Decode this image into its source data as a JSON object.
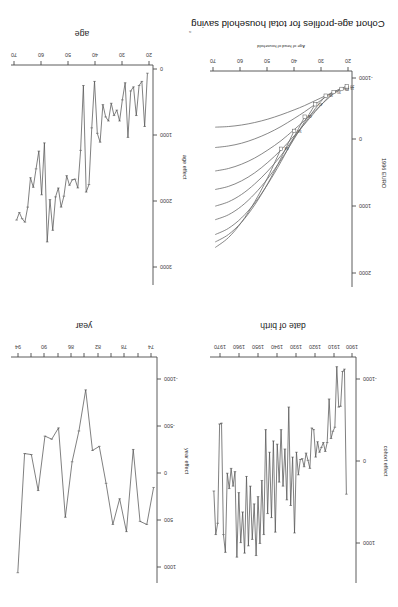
{
  "figure": {
    "orientation": "rotated-180",
    "panel_count": 4,
    "background": "#ffffff",
    "line_color": "#555555",
    "axis_color": "#4a4a4a"
  },
  "panels": {
    "cohort_profiles": {
      "position": "bottom-left",
      "title": "Cohort age-profiles for total household saving",
      "xlabel": "Age of head of household",
      "ylabel": "1996 EURO",
      "x_ticks": [
        "20",
        "30",
        "40",
        "50",
        "60",
        "70"
      ],
      "y_ticks": [
        "2000",
        "1000",
        "0",
        "-1000"
      ],
      "cohort_labels": [
        "15",
        "20",
        "25",
        "30",
        "35",
        "40",
        "45",
        "50",
        "55"
      ]
    },
    "cohort_effect": {
      "position": "top-left",
      "xlabel": "date of birth",
      "ylabel": "cohort effect",
      "x_ticks": [
        "1900",
        "1910",
        "1920",
        "1930",
        "1940",
        "1950",
        "1960",
        "1970"
      ],
      "y_ticks": [
        "1000",
        "0",
        "-1000"
      ]
    },
    "year_effect": {
      "position": "top-right",
      "xlabel": "year",
      "ylabel": "year effect",
      "x_ticks": [
        "74",
        "76",
        "78",
        "80",
        "82",
        "84",
        "86",
        "88",
        "90",
        "92",
        "94"
      ],
      "y_ticks": [
        "1000",
        "500",
        "0",
        "-500",
        "-1000"
      ]
    },
    "age_effect": {
      "position": "bottom-right",
      "xlabel": "age",
      "ylabel": "age effect",
      "x_ticks": [
        "20",
        "30",
        "40",
        "50",
        "60",
        "70"
      ],
      "y_ticks": [
        "3000",
        "2000",
        "1000",
        "0"
      ],
      "edge_fragment": "a"
    }
  },
  "chart_data": [
    {
      "id": "cohort_profiles",
      "type": "line",
      "title": "Cohort age-profiles for total household saving",
      "xlabel": "Age of head of household",
      "ylabel": "1996 EURO",
      "xlim": [
        18,
        72
      ],
      "ylim": [
        -1300,
        2200
      ],
      "grid": false,
      "legend": "inline-endpoint-labels",
      "series": [
        {
          "name": "15",
          "label_at_end": true,
          "x": [
            20,
            22,
            25,
            28,
            32,
            36,
            40,
            45,
            50,
            55,
            60,
            65,
            70
          ],
          "y": [
            -1020,
            -1000,
            -960,
            -900,
            -820,
            -740,
            -670,
            -590,
            -520,
            -465,
            -425,
            -400,
            -390
          ]
        },
        {
          "name": "20",
          "label_at_end": true,
          "x": [
            20,
            22,
            25,
            28,
            32,
            36,
            40,
            45,
            50,
            55,
            60,
            65,
            70
          ],
          "y": [
            -1050,
            -1020,
            -960,
            -880,
            -760,
            -640,
            -530,
            -400,
            -290,
            -200,
            -130,
            -85,
            -60
          ]
        },
        {
          "name": "25",
          "label_at_end": true,
          "x": [
            22,
            25,
            28,
            32,
            36,
            40,
            45,
            50,
            55,
            60,
            65,
            70
          ],
          "y": [
            -1010,
            -930,
            -820,
            -660,
            -500,
            -350,
            -170,
            -20,
            110,
            210,
            280,
            320
          ]
        },
        {
          "name": "30",
          "label_at_end": true,
          "x": [
            25,
            28,
            32,
            36,
            40,
            45,
            50,
            55,
            60,
            65,
            70
          ],
          "y": [
            -960,
            -830,
            -640,
            -440,
            -250,
            -20,
            180,
            350,
            480,
            570,
            620
          ]
        },
        {
          "name": "35",
          "label_at_end": true,
          "x": [
            28,
            32,
            36,
            40,
            45,
            50,
            55,
            60,
            65,
            70
          ],
          "y": [
            -900,
            -690,
            -450,
            -220,
            70,
            320,
            530,
            700,
            820,
            890
          ]
        },
        {
          "name": "40",
          "label_at_end": true,
          "x": [
            32,
            36,
            40,
            45,
            50,
            55,
            60,
            65,
            70
          ],
          "y": [
            -760,
            -480,
            -200,
            140,
            440,
            690,
            890,
            1030,
            1110
          ]
        },
        {
          "name": "45",
          "label_at_end": true,
          "x": [
            36,
            40,
            45,
            50,
            55,
            60,
            65,
            70
          ],
          "y": [
            -560,
            -230,
            170,
            530,
            840,
            1080,
            1250,
            1350
          ]
        },
        {
          "name": "50",
          "label_at_end": true,
          "x": [
            40,
            45,
            50,
            55,
            60,
            65,
            70
          ],
          "y": [
            -330,
            110,
            520,
            870,
            1150,
            1350,
            1470
          ]
        },
        {
          "name": "55",
          "label_at_end": true,
          "x": [
            45,
            50,
            55,
            60,
            65,
            70
          ],
          "y": [
            -40,
            420,
            820,
            1150,
            1400,
            1560
          ]
        }
      ]
    },
    {
      "id": "cohort_effect",
      "type": "line",
      "xlabel": "date of birth",
      "ylabel": "cohort effect",
      "xlim": [
        1898,
        1974
      ],
      "ylim": [
        -1300,
        1500
      ],
      "grid": false,
      "x": [
        1903,
        1904,
        1905,
        1906,
        1907,
        1908,
        1909,
        1910,
        1911,
        1912,
        1913,
        1914,
        1915,
        1916,
        1917,
        1918,
        1919,
        1920,
        1921,
        1922,
        1923,
        1924,
        1925,
        1926,
        1927,
        1928,
        1929,
        1930,
        1931,
        1932,
        1933,
        1934,
        1935,
        1936,
        1937,
        1938,
        1939,
        1940,
        1941,
        1942,
        1943,
        1944,
        1945,
        1946,
        1947,
        1948,
        1949,
        1950,
        1951,
        1952,
        1953,
        1954,
        1955,
        1956,
        1957,
        1958,
        1959,
        1960,
        1961,
        1962,
        1963,
        1964,
        1965,
        1966,
        1967,
        1968,
        1969,
        1970,
        1971,
        1972
      ],
      "y": [
        400,
        -1150,
        -1120,
        -690,
        -680,
        -1180,
        -430,
        -380,
        -290,
        -780,
        -240,
        -130,
        -240,
        -180,
        -120,
        -250,
        -60,
        -400,
        -420,
        80,
        -20,
        -110,
        60,
        -40,
        -30,
        160,
        -120,
        880,
        -60,
        540,
        -680,
        470,
        -160,
        300,
        -400,
        250,
        -220,
        870,
        -260,
        690,
        -120,
        640,
        -400,
        900,
        230,
        1010,
        430,
        1160,
        520,
        960,
        300,
        1040,
        180,
        1130,
        620,
        1000,
        380,
        1180,
        120,
        300,
        80,
        330,
        140,
        1120,
        900,
        -480,
        -470,
        760,
        900,
        360
      ]
    },
    {
      "id": "year_effect",
      "type": "line",
      "xlabel": "year",
      "ylabel": "year effect",
      "xlim": [
        73.5,
        95
      ],
      "ylim": [
        -1100,
        1100
      ],
      "grid": false,
      "x": [
        74,
        75,
        76,
        77,
        78,
        79,
        80,
        81,
        82,
        83,
        84,
        85,
        86,
        87,
        88,
        89,
        90,
        91,
        92,
        93,
        94
      ],
      "y": [
        170,
        530,
        500,
        -200,
        600,
        280,
        530,
        130,
        -230,
        -190,
        -780,
        -380,
        -80,
        460,
        -410,
        -300,
        -330,
        200,
        -150,
        -160,
        1000
      ]
    },
    {
      "id": "age_effect",
      "type": "line",
      "xlabel": "age",
      "ylabel": "age effect",
      "xlim": [
        21,
        72
      ],
      "ylim": [
        -120,
        3100
      ],
      "grid": false,
      "x": [
        23,
        24,
        25,
        26,
        27,
        28,
        29,
        30,
        31,
        32,
        33,
        34,
        35,
        36,
        37,
        38,
        39,
        40,
        41,
        42,
        43,
        44,
        45,
        46,
        47,
        48,
        49,
        50,
        51,
        52,
        53,
        54,
        55,
        56,
        57,
        58,
        59,
        60,
        61,
        62,
        63,
        64,
        65,
        66,
        67,
        68,
        69,
        70
      ],
      "y": [
        0,
        780,
        120,
        180,
        620,
        200,
        260,
        940,
        140,
        390,
        700,
        540,
        620,
        440,
        700,
        640,
        460,
        1010,
        880,
        120,
        800,
        1630,
        1740,
        180,
        1130,
        1680,
        1550,
        1560,
        1640,
        1500,
        1800,
        1960,
        1680,
        1810,
        2300,
        1850,
        2470,
        1020,
        1780,
        1140,
        1400,
        1670,
        1530,
        1960,
        2180,
        2130,
        2040,
        2150
      ]
    }
  ]
}
